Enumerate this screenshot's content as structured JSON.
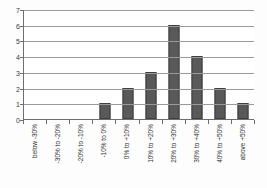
{
  "chart_data": {
    "type": "bar",
    "title": "",
    "subtitle": "",
    "xlabel": "",
    "ylabel": "",
    "categories": [
      "below -30%",
      "-30% to -20%",
      "-20% to -10%",
      "-10% to 0%",
      "0% to +10%",
      "10% to +20%",
      "20% to +30%",
      "30% to +40%",
      "40% to +50%",
      "above +50%"
    ],
    "values": [
      0,
      0,
      0,
      1,
      2,
      3,
      6,
      4,
      2,
      1
    ],
    "ylim": [
      0,
      7
    ],
    "yticks": [
      0,
      1,
      2,
      3,
      4,
      5,
      6,
      7
    ],
    "ytick_labels": [
      "0",
      "1",
      "2",
      "3",
      "4",
      "5",
      "6",
      "7"
    ],
    "grid": true,
    "legend": false,
    "legend_position": "none",
    "bar_color": "#595959",
    "bar_edge_color": "#3f3f3f",
    "axis_color": "#6e6e6e",
    "gridline_color": "#9a9a9a",
    "background_color": "#ffffff"
  }
}
